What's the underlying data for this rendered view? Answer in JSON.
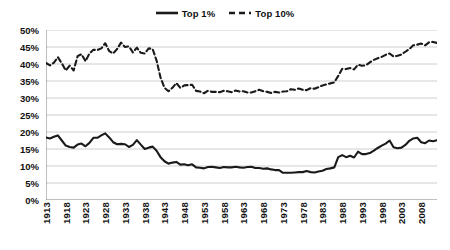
{
  "legend": {
    "position": "top-center",
    "items": [
      {
        "label": "Top 1%",
        "style": "solid",
        "color": "#1a1a1a",
        "icon": "solid-line-swatch"
      },
      {
        "label": "Top 10%",
        "style": "dashed",
        "color": "#1a1a1a",
        "icon": "dashed-line-swatch"
      }
    ]
  },
  "chart_data": {
    "type": "line",
    "title": "",
    "subtitle": "",
    "xlabel": "",
    "ylabel": "",
    "xlim": [
      1913,
      2012
    ],
    "ylim": [
      0,
      50
    ],
    "ytick_step": 5,
    "ytick_suffix": "%",
    "grid": true,
    "grid_axis": "y",
    "legend_position": "top-center",
    "ytick_labels": [
      "0%",
      "5%",
      "10%",
      "15%",
      "20%",
      "25%",
      "30%",
      "35%",
      "40%",
      "45%",
      "50%"
    ],
    "ytick_values": [
      0,
      5,
      10,
      15,
      20,
      25,
      30,
      35,
      40,
      45,
      50
    ],
    "xtick_labels": [
      "1913",
      "1918",
      "1923",
      "1928",
      "1933",
      "1938",
      "1943",
      "1948",
      "1953",
      "1958",
      "1963",
      "1968",
      "1973",
      "1978",
      "1983",
      "1988",
      "1993",
      "1998",
      "2003",
      "2008"
    ],
    "xtick_values": [
      1913,
      1918,
      1923,
      1928,
      1933,
      1938,
      1943,
      1948,
      1953,
      1958,
      1963,
      1968,
      1973,
      1978,
      1983,
      1988,
      1993,
      1998,
      2003,
      2008
    ],
    "x": [
      1913,
      1914,
      1915,
      1916,
      1917,
      1918,
      1919,
      1920,
      1921,
      1922,
      1923,
      1924,
      1925,
      1926,
      1927,
      1928,
      1929,
      1930,
      1931,
      1932,
      1933,
      1934,
      1935,
      1936,
      1937,
      1938,
      1939,
      1940,
      1941,
      1942,
      1943,
      1944,
      1945,
      1946,
      1947,
      1948,
      1949,
      1950,
      1951,
      1952,
      1953,
      1954,
      1955,
      1956,
      1957,
      1958,
      1959,
      1960,
      1961,
      1962,
      1963,
      1964,
      1965,
      1966,
      1967,
      1968,
      1969,
      1970,
      1971,
      1972,
      1973,
      1974,
      1975,
      1976,
      1977,
      1978,
      1979,
      1980,
      1981,
      1982,
      1983,
      1984,
      1985,
      1986,
      1987,
      1988,
      1989,
      1990,
      1991,
      1992,
      1993,
      1994,
      1995,
      1996,
      1997,
      1998,
      1999,
      2000,
      2001,
      2002,
      2003,
      2004,
      2005,
      2006,
      2007,
      2008,
      2009,
      2010,
      2011,
      2012
    ],
    "series": [
      {
        "name": "Top 1%",
        "style": "solid",
        "color": "#1a1a1a",
        "values": [
          18.4,
          18.1,
          18.6,
          19.0,
          17.5,
          16.0,
          15.6,
          15.4,
          16.3,
          16.6,
          15.8,
          16.8,
          18.3,
          18.3,
          19.0,
          19.6,
          18.4,
          17.0,
          16.4,
          16.5,
          16.4,
          15.6,
          16.2,
          17.6,
          16.3,
          15.0,
          15.4,
          15.7,
          14.5,
          12.6,
          11.4,
          10.7,
          11.0,
          11.2,
          10.4,
          10.5,
          10.2,
          10.5,
          9.6,
          9.5,
          9.3,
          9.7,
          9.8,
          9.6,
          9.4,
          9.7,
          9.6,
          9.6,
          9.8,
          9.6,
          9.5,
          9.7,
          9.8,
          9.4,
          9.4,
          9.2,
          9.3,
          9.0,
          8.8,
          8.8,
          8.0,
          8.0,
          8.0,
          8.1,
          8.2,
          8.2,
          8.5,
          8.2,
          8.1,
          8.4,
          8.6,
          9.1,
          9.3,
          9.6,
          12.6,
          13.2,
          12.6,
          13.0,
          12.5,
          14.2,
          13.5,
          13.5,
          13.8,
          14.5,
          15.3,
          16.0,
          16.6,
          17.5,
          15.5,
          15.2,
          15.4,
          16.2,
          17.4,
          18.1,
          18.3,
          17.0,
          16.7,
          17.5,
          17.3,
          17.6
        ]
      },
      {
        "name": "Top 10%",
        "style": "dashed",
        "color": "#1a1a1a",
        "values": [
          40.3,
          39.6,
          40.4,
          42.0,
          40.2,
          38.1,
          39.5,
          38.1,
          42.3,
          42.9,
          40.8,
          43.1,
          44.2,
          44.1,
          44.6,
          46.1,
          43.8,
          43.1,
          44.4,
          46.3,
          45.0,
          45.2,
          43.4,
          44.8,
          43.3,
          43.1,
          44.6,
          44.4,
          41.0,
          36.0,
          33.0,
          32.0,
          33.0,
          34.4,
          33.0,
          33.7,
          33.8,
          33.9,
          32.1,
          31.9,
          31.4,
          32.1,
          31.8,
          31.8,
          31.7,
          32.1,
          32.0,
          31.7,
          32.2,
          31.9,
          32.0,
          31.6,
          31.6,
          32.0,
          32.4,
          32.0,
          31.8,
          31.5,
          31.8,
          31.6,
          31.9,
          32.0,
          32.6,
          32.4,
          32.8,
          32.4,
          32.3,
          32.9,
          32.7,
          33.2,
          33.7,
          34.0,
          34.3,
          34.6,
          36.5,
          38.6,
          38.5,
          38.8,
          38.4,
          39.8,
          39.5,
          39.6,
          40.5,
          41.2,
          41.7,
          42.1,
          42.7,
          43.1,
          42.2,
          42.4,
          42.8,
          43.6,
          44.4,
          45.5,
          45.7,
          46.0,
          45.5,
          46.4,
          46.5,
          46.2
        ]
      }
    ]
  }
}
